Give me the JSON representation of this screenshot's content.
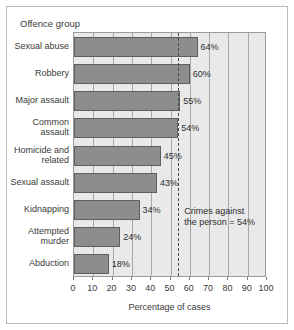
{
  "figure": {
    "category_axis_header": "Offence group",
    "annotation_line1": "Crimes against",
    "annotation_line2": "the person = 54%",
    "bar_color": "#8d8d8d",
    "bar_border_color": "#5f5f5f",
    "plot_background": "#e9e9e9",
    "gridline_color": "#a8a8a8",
    "threshold_color": "#4a4a4a"
  },
  "chart_data": {
    "type": "bar",
    "orientation": "horizontal",
    "title": "",
    "xlabel": "Percentage of cases",
    "ylabel": "Offence group",
    "xlim": [
      0,
      100
    ],
    "xticks": [
      0,
      10,
      20,
      30,
      40,
      50,
      60,
      70,
      80,
      90,
      100
    ],
    "xtick_labels": [
      "0",
      "10",
      "20",
      "30",
      "40",
      "50",
      "60",
      "70",
      "80",
      "90",
      "100"
    ],
    "grid": true,
    "legend": false,
    "categories": [
      "Sexual abuse",
      "Robbery",
      "Major assault",
      "Common assault",
      "Homicide and related",
      "Sexual assault",
      "Kidnapping",
      "Attempted murder",
      "Abduction"
    ],
    "category_lines": [
      [
        "Sexual abuse"
      ],
      [
        "Robbery"
      ],
      [
        "Major assault"
      ],
      [
        "Common",
        "assault"
      ],
      [
        "Homicide and",
        "related"
      ],
      [
        "Sexual assault"
      ],
      [
        "Kidnapping"
      ],
      [
        "Attempted",
        "murder"
      ],
      [
        "Abduction"
      ]
    ],
    "values": [
      64,
      60,
      55,
      54,
      45,
      43,
      34,
      24,
      18
    ],
    "data_labels": [
      "64%",
      "60%",
      "55%",
      "54%",
      "45%",
      "43%",
      "34%",
      "24%",
      "18%"
    ],
    "reference_line": {
      "value": 54,
      "style": "dashed",
      "label": "Crimes against the person = 54%"
    }
  }
}
